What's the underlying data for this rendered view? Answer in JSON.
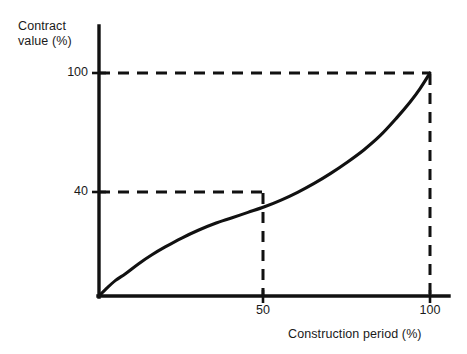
{
  "chart_data": {
    "type": "line",
    "title": "",
    "subtitle": "",
    "xlabel": "Construction period (%)",
    "ylabel": "Contract value (%)",
    "ylabel_line1": "Contract",
    "ylabel_line2": "value (%)",
    "xlim": [
      0,
      100
    ],
    "ylim": [
      0,
      100
    ],
    "xticks": [
      50,
      100
    ],
    "xtick_labels": [
      "50",
      "100"
    ],
    "yticks": [
      40,
      100
    ],
    "ytick_labels": [
      "40",
      "100"
    ],
    "grid": false,
    "legend": null,
    "legend_position": "none",
    "series": [
      {
        "name": "S-curve (cumulative contract value)",
        "style": "solid",
        "color": "#111111",
        "x": [
          0,
          2,
          5,
          8,
          12,
          16,
          20,
          25,
          30,
          35,
          40,
          45,
          50,
          55,
          60,
          65,
          70,
          75,
          80,
          85,
          90,
          94,
          97,
          100
        ],
        "y": [
          0,
          3,
          7,
          10,
          14.5,
          18.5,
          22,
          26,
          29.5,
          32.5,
          35,
          37.5,
          40,
          43,
          46.5,
          50.5,
          55,
          60,
          65.5,
          72,
          80,
          87,
          93,
          100
        ]
      }
    ],
    "annotations": [
      {
        "name": "reference-line-value-100",
        "type": "dashed-horizontal",
        "y": 100,
        "from_x": 0,
        "to_x": 100
      },
      {
        "name": "reference-line-value-40",
        "type": "dashed-horizontal",
        "y": 40,
        "from_x": 0,
        "to_x": 50
      },
      {
        "name": "reference-line-period-50",
        "type": "dashed-vertical",
        "x": 50,
        "from_y": 0,
        "to_y": 40
      },
      {
        "name": "reference-line-period-100",
        "type": "dashed-vertical",
        "x": 100,
        "from_y": 0,
        "to_y": 100
      }
    ],
    "key_points": [
      {
        "label": "midpoint",
        "x": 50,
        "y": 40
      },
      {
        "label": "completion",
        "x": 100,
        "y": 100
      }
    ],
    "colors": {
      "background": "#ffffff",
      "axis": "#111111",
      "curve": "#111111",
      "dashed": "#111111",
      "text": "#1a1a1a"
    }
  }
}
